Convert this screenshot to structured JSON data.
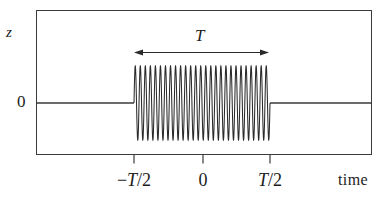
{
  "figure": {
    "background_color": "#ffffff",
    "line_color": "#3a3a3a",
    "curve_color": "#2b2b2b",
    "text_color": "#1c1c1c",
    "y_axis_label": "z",
    "y_zero_label": "0",
    "x_axis_label": "time",
    "duration_label": "T",
    "tick_labels": [
      "−T/2",
      "0",
      "T/2"
    ],
    "tick_label_parts": [
      {
        "prefix": "−",
        "italic": "T",
        "suffix": "/2"
      },
      {
        "prefix": "",
        "italic": "",
        "suffix": "0"
      },
      {
        "prefix": "",
        "italic": "T",
        "suffix": "/2"
      }
    ]
  },
  "chart_data": {
    "type": "line",
    "title": "",
    "xlabel": "time",
    "ylabel": "z",
    "x_tick_values": [
      -0.5,
      0,
      0.5
    ],
    "x_tick_labels": [
      "−T/2",
      "0",
      "T/2"
    ],
    "y_tick_values": [
      0
    ],
    "y_tick_labels": [
      "0"
    ],
    "xlim": [
      -1.19,
      1.19
    ],
    "ylim": [
      -1.45,
      1.45
    ],
    "grid": false,
    "legend": false,
    "series": [
      {
        "name": "wave train z(t)",
        "type": "sinusoidal-burst",
        "amplitude": 1.0,
        "cycles_in_burst": 27,
        "burst_start": -0.5,
        "burst_end": 0.5,
        "value_outside_burst": 0
      }
    ],
    "annotations": [
      {
        "type": "double-headed-arrow",
        "label": "T",
        "from_x": -0.5,
        "to_x": 0.5,
        "y": 1.21,
        "meaning": "duration of the wave train"
      }
    ]
  }
}
